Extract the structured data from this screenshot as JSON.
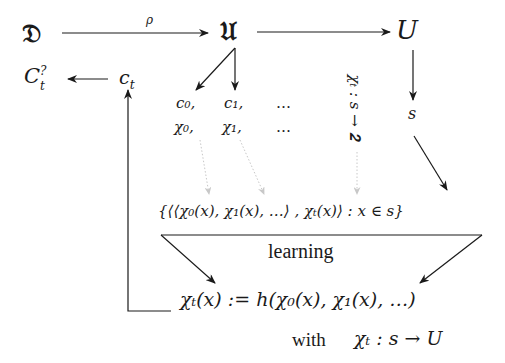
{
  "nodes": {
    "D": "𝔇",
    "U_frak": "𝔘",
    "U": "U",
    "C_t_q": "C",
    "C_t_q_sub": "t",
    "C_t_q_sup": "?",
    "c_t": "c",
    "c_t_sub": "t",
    "s": "s",
    "c_row": [
      "c₀,",
      "c₁,",
      "…"
    ],
    "chi_row": [
      "χ₀,",
      "χ₁,",
      "…"
    ],
    "chi_t_rotated": "χₜ : s → 𝟐"
  },
  "edges": {
    "rho_label": "ρ"
  },
  "set_expression": "{⟨⟨χ₀(x), χ₁(x), …⟩ , χₜ(x)⟩ : x ∈ s}",
  "learning_label": "learning",
  "formula": "χₜ(x) := h(χ₀(x), χ₁(x), …)",
  "with_label": "with",
  "with_formula": "χₜ : s → U",
  "colors": {
    "ink": "#1a1a1a",
    "dotted": "#c8c8c8"
  }
}
